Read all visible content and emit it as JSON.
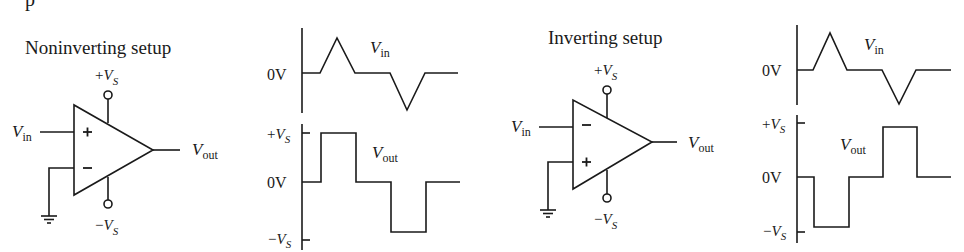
{
  "header": {
    "partial_text": "p"
  },
  "noninverting": {
    "title": "Noninverting setup",
    "supply_pos": {
      "sign": "+",
      "v": "V",
      "sub": "S"
    },
    "supply_neg": {
      "sign": "−",
      "v": "V",
      "sub": "S"
    },
    "input_label": {
      "v": "V",
      "sub": "in"
    },
    "output_label": {
      "v": "V",
      "sub": "out"
    },
    "top_input_sign": "+",
    "bottom_input_sign": "−",
    "chart": {
      "vin_label": {
        "v": "V",
        "sub": "in"
      },
      "vout_label": {
        "v": "V",
        "sub": "out"
      },
      "zero_label": "0V",
      "pos_label": {
        "sign": "+",
        "v": "V",
        "sub": "S"
      },
      "neg_label": {
        "sign": "−",
        "v": "V",
        "sub": "S"
      }
    }
  },
  "inverting": {
    "title": "Inverting setup",
    "supply_pos": {
      "sign": "+",
      "v": "V",
      "sub": "S"
    },
    "supply_neg": {
      "sign": "−",
      "v": "V",
      "sub": "S"
    },
    "input_label": {
      "v": "V",
      "sub": "in"
    },
    "output_label": {
      "v": "V",
      "sub": "out"
    },
    "top_input_sign": "−",
    "bottom_input_sign": "+",
    "chart": {
      "vin_label": {
        "v": "V",
        "sub": "in"
      },
      "vout_label": {
        "v": "V",
        "sub": "out"
      },
      "zero_label": "0V",
      "pos_label": {
        "sign": "+",
        "v": "V",
        "sub": "S"
      },
      "neg_label": {
        "sign": "−",
        "v": "V",
        "sub": "S"
      }
    }
  }
}
